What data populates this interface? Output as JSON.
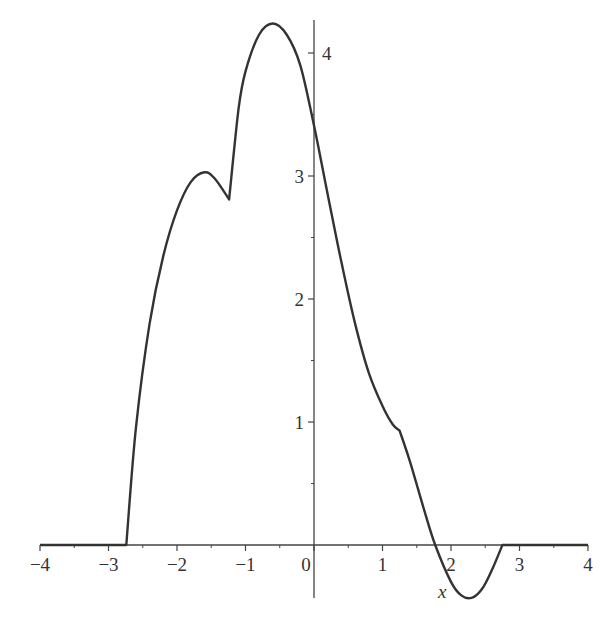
{
  "chart_data": {
    "type": "line",
    "title": "",
    "xlabel": "x",
    "ylabel": "",
    "xlim": [
      -4,
      4
    ],
    "ylim": [
      -0.45,
      4.3
    ],
    "grid": false,
    "legend": null,
    "x_ticks": [
      -4,
      -3,
      -2,
      -1,
      0,
      1,
      2,
      3,
      4
    ],
    "x_tick_labels": [
      "−4",
      "−3",
      "−2",
      "−1",
      "0",
      "1",
      "2",
      "3",
      "4"
    ],
    "y_ticks": [
      1,
      2,
      3,
      4
    ],
    "y_tick_labels": [
      "1",
      "2",
      "3",
      "4"
    ],
    "series": [
      {
        "name": "f(x)",
        "color": "#333333",
        "x": [
          -4,
          -2.74,
          -2.6,
          -2.4,
          -2.2,
          -2.0,
          -1.8,
          -1.6,
          -1.45,
          -1.24,
          -1.1,
          -1.0,
          -0.8,
          -0.6,
          -0.4,
          -0.2,
          0.0,
          0.2,
          0.4,
          0.6,
          0.8,
          1.0,
          1.15,
          1.25,
          1.4,
          1.6,
          1.77,
          2.0,
          2.15,
          2.3,
          2.45,
          2.6,
          2.75,
          3.0,
          3.5,
          4.0
        ],
        "values": [
          0,
          0,
          0.95,
          1.8,
          2.35,
          2.72,
          2.95,
          3.03,
          2.98,
          2.81,
          3.55,
          3.85,
          4.15,
          4.24,
          4.15,
          3.9,
          3.41,
          2.85,
          2.3,
          1.8,
          1.4,
          1.13,
          0.98,
          0.93,
          0.68,
          0.3,
          0.0,
          -0.3,
          -0.41,
          -0.43,
          -0.36,
          -0.2,
          0,
          0,
          0,
          0
        ]
      }
    ],
    "annotations": []
  }
}
